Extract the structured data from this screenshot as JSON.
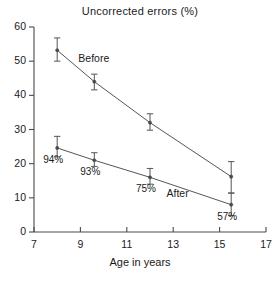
{
  "chart_data": {
    "type": "line",
    "title": "Uncorrected errors (%)",
    "xlabel": "Age in years",
    "ylabel": "",
    "xlim": [
      7,
      17
    ],
    "ylim": [
      0,
      60
    ],
    "xticks": [
      7,
      9,
      11,
      13,
      15,
      17
    ],
    "yticks": [
      0,
      10,
      20,
      30,
      40,
      50,
      60
    ],
    "xtick_labels": [
      "7",
      "9",
      "11",
      "13",
      "15",
      "17"
    ],
    "ytick_labels": [
      "0",
      "10",
      "20",
      "30",
      "40",
      "50",
      "60"
    ],
    "grid": false,
    "legend_position": "inline-annotation",
    "x": [
      8.0,
      9.6,
      12.0,
      15.5
    ],
    "series": [
      {
        "name": "Before",
        "label": "Before",
        "values": [
          53.2,
          44.0,
          32.0,
          16.2
        ],
        "err_low": [
          3.2,
          2.4,
          2.2,
          4.8
        ],
        "err_high": [
          3.6,
          2.2,
          2.6,
          4.4
        ]
      },
      {
        "name": "After",
        "label": "After",
        "values": [
          24.6,
          21.0,
          16.0,
          8.0
        ],
        "err_low": [
          2.6,
          1.8,
          2.0,
          3.2
        ],
        "err_high": [
          3.4,
          2.2,
          2.6,
          3.4
        ]
      }
    ],
    "point_annotations": [
      {
        "text": "94%",
        "x": 8.0,
        "y": 24.6
      },
      {
        "text": "93%",
        "x": 9.6,
        "y": 21.0
      },
      {
        "text": "75%",
        "x": 12.0,
        "y": 16.0
      },
      {
        "text": "57%",
        "x": 15.5,
        "y": 8.0
      }
    ],
    "series_annotations": [
      {
        "text": "Before",
        "x": 9.6,
        "y": 50.5
      },
      {
        "text": "After",
        "x": 13.4,
        "y": 11.0
      }
    ],
    "colors": {
      "line": "#555555",
      "marker": "#4a4a4a",
      "axis": "#4a4a4a",
      "text": "#1a1a1a",
      "background": "#ffffff"
    }
  },
  "axis_titles": {
    "x": "Age in years",
    "y": ""
  }
}
